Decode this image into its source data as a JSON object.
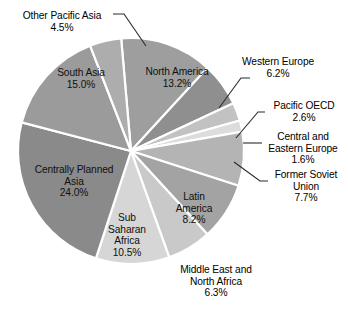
{
  "chart_data": {
    "type": "pie",
    "title": "",
    "subtitle": "",
    "xlabel": "",
    "ylabel": "",
    "legend_position": "none",
    "grid": false,
    "units": "percent",
    "start_angle_deg": -5,
    "direction": "clockwise",
    "categories": [
      "North America",
      "Western Europe",
      "Pacific OECD",
      "Central and Eastern Europe",
      "Former Soviet Union",
      "Latin America",
      "Middle East and North Africa",
      "Sub Saharan Africa",
      "Centrally Planned Asia",
      "South Asia",
      "Other Pacific Asia"
    ],
    "values": [
      13.2,
      6.2,
      2.6,
      1.6,
      7.7,
      8.2,
      6.3,
      10.5,
      24.0,
      15.0,
      4.5
    ],
    "value_labels": [
      "13.2%",
      "6.2%",
      "2.6%",
      "1.6%",
      "7.7%",
      "8.2%",
      "6.3%",
      "10.5%",
      "24.0%",
      "15.0%",
      "4.5%"
    ],
    "colors": [
      "#9e9e9e",
      "#8f8f8f",
      "#c2c2c2",
      "#dcdcdc",
      "#b4b4b4",
      "#a3a3a3",
      "#c9c9c9",
      "#d6d6d6",
      "#8a8a8a",
      "#9b9b9b",
      "#adadad"
    ],
    "slice_label_placement": [
      "inside",
      "outside",
      "outside",
      "outside",
      "outside",
      "inside",
      "outside",
      "inside",
      "inside",
      "inside",
      "outside"
    ]
  },
  "slices": {
    "north_america": {
      "name": "North America",
      "pct": "13.2%"
    },
    "western_europe": {
      "name": "Western Europe",
      "pct": "6.2%"
    },
    "pacific_oecd": {
      "name": "Pacific OECD",
      "pct": "2.6%"
    },
    "central_eastern_europe": {
      "name_line1": "Central and",
      "name_line2": "Eastern Europe",
      "pct": "1.6%"
    },
    "former_soviet_union": {
      "name_line1": "Former Soviet",
      "name_line2": "Union",
      "pct": "7.7%"
    },
    "latin_america": {
      "name_line1": "Latin",
      "name_line2": "America",
      "pct": "8.2%"
    },
    "middle_east_north_africa": {
      "name_line1": "Middle East and",
      "name_line2": "North Africa",
      "pct": "6.3%"
    },
    "sub_saharan_africa": {
      "name_line1": "Sub",
      "name_line2": "Saharan",
      "name_line3": "Africa",
      "pct": "10.5%"
    },
    "centrally_planned_asia": {
      "name_line1": "Centrally Planned",
      "name_line2": "Asia",
      "pct": "24.0%"
    },
    "south_asia": {
      "name": "South Asia",
      "pct": "15.0%"
    },
    "other_pacific_asia": {
      "name": "Other Pacific Asia",
      "pct": "4.5%"
    }
  }
}
